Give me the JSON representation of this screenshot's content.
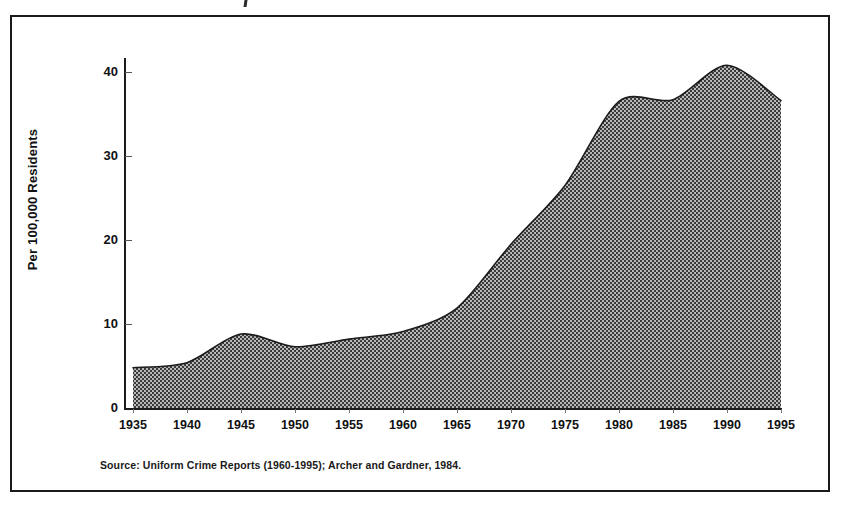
{
  "figure": {
    "source_note": "Source:  Uniform Crime Reports (1960-1995); Archer and Gardner, 1984.",
    "frame_color": "#1a1a1a",
    "background_color": "#ffffff"
  },
  "chart_data": {
    "type": "area",
    "title": "",
    "subtitle": "",
    "xlabel": "",
    "ylabel": "Per 100,000 Residents",
    "x": [
      1935,
      1940,
      1945,
      1950,
      1955,
      1960,
      1965,
      1970,
      1975,
      1980,
      1985,
      1990,
      1995
    ],
    "categories": [
      "1935",
      "1940",
      "1945",
      "1950",
      "1955",
      "1960",
      "1965",
      "1970",
      "1975",
      "1980",
      "1985",
      "1990",
      "1995"
    ],
    "values": [
      4.8,
      5.4,
      8.8,
      7.3,
      8.2,
      9.1,
      11.9,
      19.5,
      26.5,
      36.5,
      36.7,
      40.8,
      36.6
    ],
    "series": [
      {
        "name": "Rate per 100,000 residents",
        "values": [
          4.8,
          5.4,
          8.8,
          7.3,
          8.2,
          9.1,
          11.9,
          19.5,
          26.5,
          36.5,
          36.7,
          40.8,
          36.6
        ]
      }
    ],
    "xlim": [
      1935,
      1995
    ],
    "ylim": [
      0,
      44
    ],
    "y_ticks": [
      0,
      10,
      20,
      30,
      40
    ],
    "y_tick_labels": [
      "0",
      "10",
      "20",
      "30",
      "40"
    ],
    "x_ticks": [
      1935,
      1940,
      1945,
      1950,
      1955,
      1960,
      1965,
      1970,
      1975,
      1980,
      1985,
      1990,
      1995
    ],
    "x_tick_labels": [
      "1935",
      "1940",
      "1945",
      "1950",
      "1955",
      "1960",
      "1965",
      "1970",
      "1975",
      "1980",
      "1985",
      "1990",
      "1995"
    ],
    "grid": false,
    "legend": false,
    "legend_position": "none",
    "fill_style": "checkerboard-dither",
    "fill_color": "#8a8a8a",
    "line_color": "#1c1c1c",
    "smoothing": "spline",
    "annotations": []
  }
}
